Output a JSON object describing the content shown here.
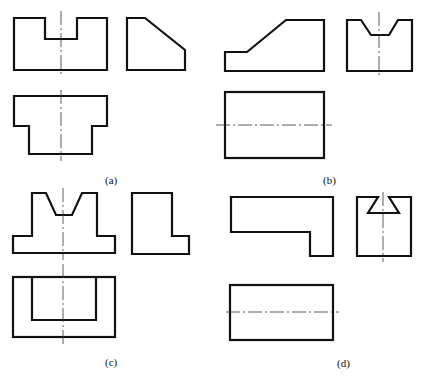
{
  "figures": [
    {
      "id": "a",
      "label": "(a)",
      "views": [
        "front",
        "side",
        "top"
      ]
    },
    {
      "id": "b",
      "label": "(b)",
      "views": [
        "front",
        "side",
        "top"
      ]
    },
    {
      "id": "c",
      "label": "(c)",
      "views": [
        "front",
        "side",
        "top"
      ]
    },
    {
      "id": "d",
      "label": "(d)",
      "views": [
        "front",
        "side",
        "top"
      ]
    }
  ],
  "colors": {
    "line": "#111111",
    "centerline": "#333333",
    "background": "#ffffff"
  }
}
